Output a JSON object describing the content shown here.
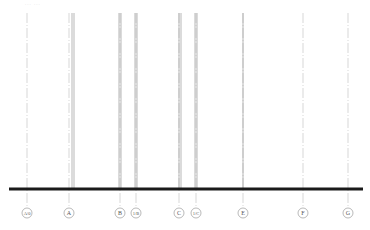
{
  "drawing": {
    "title_fragment": "... ...",
    "ground_line": {
      "y": 189,
      "x1": 9,
      "x2": 363,
      "color": "#1a1a1a",
      "thickness": 3
    },
    "axes": [
      {
        "label": "A/0",
        "x": 27,
        "style": "dash-dot",
        "bubble_y": 213
      },
      {
        "label": "A",
        "x": 69,
        "style": "dash-dot",
        "bubble_y": 213,
        "walls": [
          72,
          74
        ]
      },
      {
        "label": "B",
        "x": 120,
        "style": "dash-dot",
        "bubble_y": 213,
        "walls": [
          119,
          121
        ]
      },
      {
        "label": "1/B",
        "x": 136,
        "style": "dash-dot",
        "bubble_y": 213,
        "walls": [
          135,
          137
        ]
      },
      {
        "label": "C",
        "x": 179,
        "style": "dash-dot",
        "bubble_y": 213,
        "walls": [
          179,
          181
        ]
      },
      {
        "label": "1/C",
        "x": 196,
        "style": "dash-dot",
        "bubble_y": 213,
        "walls": [
          195,
          197
        ]
      },
      {
        "label": "E",
        "x": 243,
        "style": "dash-dot",
        "bubble_y": 213,
        "walls": [
          243
        ]
      },
      {
        "label": "F",
        "x": 303,
        "style": "dash-dot",
        "bubble_y": 213
      },
      {
        "label": "G",
        "x": 348,
        "style": "dash-dot",
        "bubble_y": 213
      }
    ],
    "colors": {
      "axis": "#bdbdbd",
      "wall": "#9a9a9a",
      "bubble": "#8a8a8a",
      "text": "#555555"
    }
  }
}
